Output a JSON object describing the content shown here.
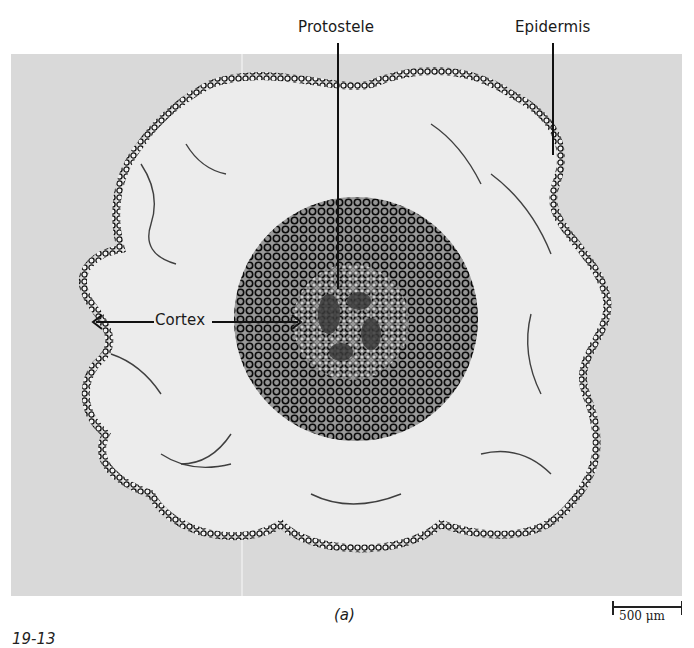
{
  "figure": {
    "panel_label": "(a)",
    "figure_number_partial": "19-13",
    "scale_bar": {
      "value": "500",
      "unit": "μm",
      "text": "500 μm"
    }
  },
  "labels": {
    "protostele": "Protostele",
    "epidermis": "Epidermis",
    "cortex": "Cortex"
  },
  "colors": {
    "background": "#ffffff",
    "photo_background": "#d9d9d9",
    "tissue_dark": "#111111",
    "cortex_fill": "#ececec",
    "stele_fill": "#b8b8b8"
  }
}
